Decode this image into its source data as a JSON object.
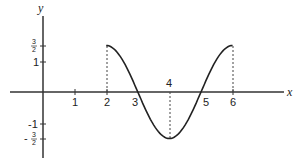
{
  "chart_data": {
    "type": "line",
    "title": "",
    "xlabel": "x",
    "ylabel": "y",
    "function": "y = (3/2) cos(pi (x - 2) / 2)",
    "domain": [
      2,
      6
    ],
    "x": [
      2,
      2.5,
      3,
      3.5,
      4,
      4.5,
      5,
      5.5,
      6
    ],
    "series": [
      {
        "name": "curve",
        "values": [
          1.5,
          1.06,
          0,
          -1.06,
          -1.5,
          -1.06,
          0,
          1.06,
          1.5
        ]
      }
    ],
    "xticks": [
      {
        "value": 1,
        "label": "1"
      },
      {
        "value": 2,
        "label": "2"
      },
      {
        "value": 3,
        "label": "3"
      },
      {
        "value": 4,
        "label": "4"
      },
      {
        "value": 5,
        "label": "5"
      },
      {
        "value": 6,
        "label": "6"
      }
    ],
    "yticks": [
      {
        "value": 1.5,
        "label": "3/2"
      },
      {
        "value": 1,
        "label": "1"
      },
      {
        "value": -1,
        "label": "-1"
      },
      {
        "value": -1.5,
        "label": "-3/2"
      }
    ],
    "dashed_guides_at_x": [
      2,
      4,
      6
    ],
    "grid": false,
    "legend": "none"
  },
  "labels": {
    "x_axis": "x",
    "y_axis": "y",
    "x1": "1",
    "x2": "2",
    "x3": "3",
    "x4": "4",
    "x5": "5",
    "x6": "6",
    "y1": "1",
    "yneg1": "-1",
    "frac_num": "3",
    "frac_den": "2",
    "minus": "-"
  }
}
